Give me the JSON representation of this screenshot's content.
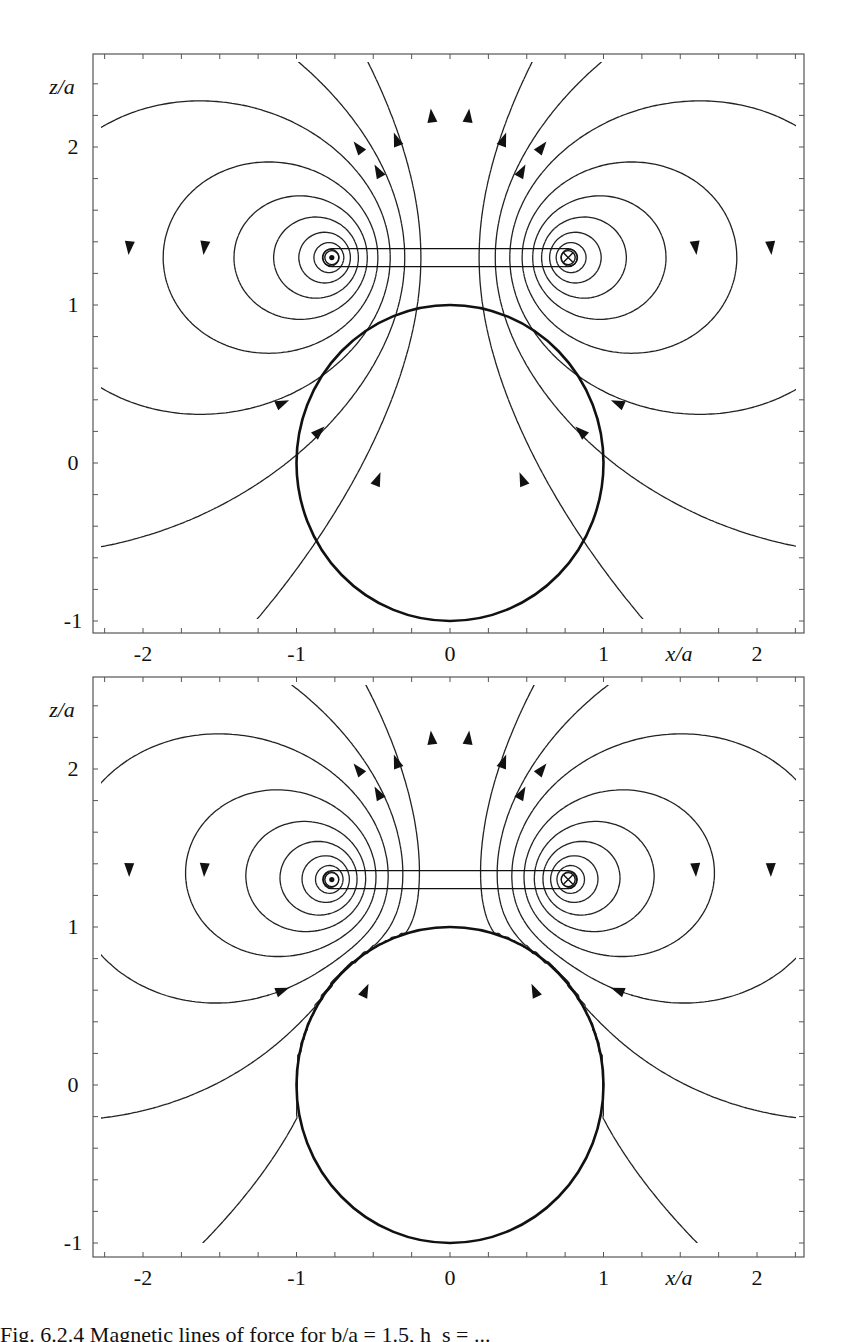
{
  "figure": {
    "caption_visible": "Fig. 6.2.4  Magnetic lines of force for b/a = 1.5, h_s = ...",
    "panels": [
      {
        "id": "top",
        "label": "sphere-permeable"
      },
      {
        "id": "bottom",
        "label": "sphere-perfect-conductor"
      }
    ]
  },
  "chart_data": [
    {
      "type": "contour",
      "title": "Magnetic field lines of current loop above sphere (field penetrates sphere)",
      "xlabel": "x/a",
      "ylabel": "z/a",
      "xlim": [
        -2.3,
        2.3
      ],
      "ylim": [
        -1.1,
        2.6
      ],
      "xticks": [
        -2,
        -1,
        0,
        1,
        2
      ],
      "yticks": [
        -1,
        0,
        1,
        2
      ],
      "loop": {
        "radius": 0.77,
        "height": 1.3,
        "left_symbol": "current-out (dot)",
        "right_symbol": "current-in (cross)"
      },
      "sphere": {
        "radius": 1.0,
        "center": [
          0,
          0
        ]
      },
      "sphere_excludes_field": false
    },
    {
      "type": "contour",
      "title": "Magnetic field lines of current loop above sphere (field excluded from sphere)",
      "xlabel": "x/a",
      "ylabel": "z/a",
      "xlim": [
        -2.3,
        2.3
      ],
      "ylim": [
        -1.1,
        2.6
      ],
      "xticks": [
        -2,
        -1,
        0,
        1,
        2
      ],
      "yticks": [
        -1,
        0,
        1,
        2
      ],
      "loop": {
        "radius": 0.77,
        "height": 1.3,
        "left_symbol": "current-out (dot)",
        "right_symbol": "current-in (cross)"
      },
      "sphere": {
        "radius": 1.0,
        "center": [
          0,
          0
        ]
      },
      "sphere_excludes_field": true
    }
  ],
  "layout": {
    "panels": [
      {
        "frame": [
          93,
          54,
          804,
          633
        ],
        "x0": 450,
        "xs": 153.5,
        "z0": 463,
        "zs": 158
      },
      {
        "frame": [
          93,
          677,
          804,
          1257
        ],
        "x0": 450,
        "xs": 153.5,
        "z0": 1085,
        "zs": 158
      }
    ],
    "tick_labels": {
      "x": [
        "-2",
        "-1",
        "0",
        "1",
        "2"
      ],
      "y": [
        "-1",
        "0",
        "1",
        "2"
      ]
    },
    "axis_names": {
      "x": "x/a",
      "y": "z/a"
    }
  }
}
